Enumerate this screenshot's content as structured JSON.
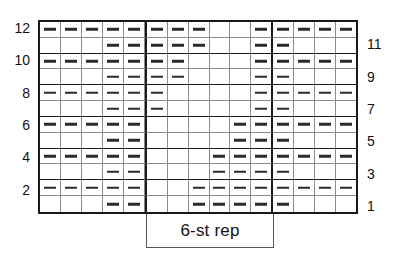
{
  "chart_data": {
    "type": "heatmap",
    "title": "",
    "xlabel": "",
    "ylabel": "",
    "columns": 15,
    "rows": 12,
    "symbols": {
      "purl": "–",
      "knit": ""
    },
    "repeat": {
      "label": "6-st rep",
      "start_column": 6,
      "end_column": 11,
      "width": 6
    },
    "row_labels_left": [
      "12",
      "10",
      "8",
      "6",
      "4",
      "2"
    ],
    "row_labels_right": [
      "11",
      "9",
      "7",
      "5",
      "3",
      "1"
    ],
    "grid": [
      {
        "row": 12,
        "side": "left",
        "purl_columns": [
          1,
          2,
          3,
          4,
          5,
          6,
          7,
          8,
          11,
          12,
          13,
          14,
          15
        ]
      },
      {
        "row": 11,
        "side": "right",
        "purl_columns": [
          4,
          5,
          6,
          7,
          8,
          11,
          12
        ]
      },
      {
        "row": 10,
        "side": "left",
        "purl_columns": [
          1,
          2,
          3,
          4,
          5,
          6,
          7,
          11,
          12,
          13,
          14,
          15
        ]
      },
      {
        "row": 9,
        "side": "right",
        "purl_columns": [
          4,
          5,
          6,
          7,
          11,
          12
        ]
      },
      {
        "row": 8,
        "side": "left",
        "purl_columns": [
          1,
          2,
          3,
          4,
          5,
          6,
          11,
          12,
          13,
          14,
          15
        ]
      },
      {
        "row": 7,
        "side": "right",
        "purl_columns": [
          4,
          5,
          6,
          11,
          12
        ]
      },
      {
        "row": 6,
        "side": "left",
        "purl_columns": [
          1,
          2,
          3,
          4,
          5,
          10,
          11,
          12,
          13,
          14,
          15
        ]
      },
      {
        "row": 5,
        "side": "right",
        "purl_columns": [
          4,
          5,
          10,
          11,
          12
        ]
      },
      {
        "row": 4,
        "side": "left",
        "purl_columns": [
          1,
          2,
          3,
          4,
          5,
          9,
          10,
          11,
          12,
          13,
          14,
          15
        ]
      },
      {
        "row": 3,
        "side": "right",
        "purl_columns": [
          4,
          5,
          9,
          10,
          11,
          12
        ]
      },
      {
        "row": 2,
        "side": "left",
        "purl_columns": [
          1,
          2,
          3,
          4,
          5,
          8,
          9,
          10,
          11,
          12,
          13,
          14,
          15
        ]
      },
      {
        "row": 1,
        "side": "right",
        "purl_columns": [
          4,
          5,
          8,
          9,
          10,
          11,
          12
        ]
      }
    ],
    "colors": {
      "border": "#1a1a1a",
      "gridline": "#8c8c8c",
      "symbol": "#2b2b2b",
      "background": "#ffffff"
    }
  }
}
